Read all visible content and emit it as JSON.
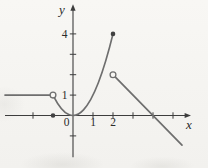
{
  "figure": {
    "background_color": "#f7f6f3",
    "axis_color": "#3d3d3d",
    "curve_color": "#6e6e6e",
    "point_fill_color": "#414141",
    "text_color": "#2b2b2b"
  },
  "chart_data": {
    "type": "line",
    "title": "",
    "xlabel": "x",
    "ylabel": "y",
    "origin_label": "0",
    "grid": false,
    "xlim": [
      -3.4,
      5.9
    ],
    "ylim": [
      -2.05,
      5.45
    ],
    "x_ticks": [
      -2,
      1,
      2,
      3,
      4,
      5
    ],
    "y_ticks": [
      -1,
      1,
      2,
      3,
      4
    ],
    "x_tick_labels": [
      {
        "value": 1,
        "label": "1"
      },
      {
        "value": 2,
        "label": "2"
      }
    ],
    "y_tick_labels": [
      {
        "value": 1,
        "label": "1"
      },
      {
        "value": 4,
        "label": "4"
      }
    ],
    "series": [
      {
        "name": "constant-branch",
        "kind": "segment",
        "equation": "y = 1, x < -1",
        "points": [
          [
            -3.4,
            1
          ],
          [
            -1,
            1
          ]
        ]
      },
      {
        "name": "parabola-branch",
        "kind": "parabola",
        "equation": "y = x^2, -1 < x <= 2",
        "x_range": [
          -0.95,
          2
        ]
      },
      {
        "name": "linear-branch",
        "kind": "segment",
        "equation": "y = 4 - x, x > 2",
        "points": [
          [
            2,
            2
          ],
          [
            5.45,
            -1.45
          ]
        ]
      }
    ],
    "markers": [
      {
        "name": "open-point-at-(-1,1)",
        "x": -1,
        "y": 1,
        "style": "open"
      },
      {
        "name": "filled-point-at-(-1,0)",
        "x": -1,
        "y": 0,
        "style": "filled"
      },
      {
        "name": "filled-point-at-(2,4)",
        "x": 2,
        "y": 4,
        "style": "filled"
      },
      {
        "name": "open-point-at-(2,2)",
        "x": 2,
        "y": 2,
        "style": "open"
      }
    ]
  }
}
